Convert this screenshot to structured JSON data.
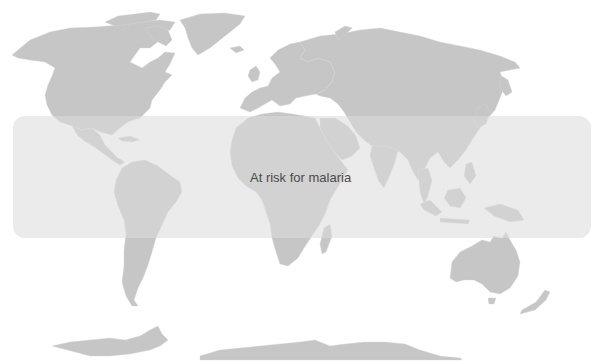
{
  "map": {
    "type": "world-map",
    "projection": "equirectangular-like",
    "colors": {
      "background": "#ffffff",
      "land": "#c6c6c6",
      "risk_band": "#e6e6e6",
      "label_text": "#4a4a4a"
    },
    "risk_zone": {
      "label": "At risk for malaria",
      "shape": "rounded-rectangle band across tropics",
      "bounds_px": {
        "x": 13,
        "y": 116,
        "width": 578,
        "height": 122
      }
    },
    "regions_shown": [
      "North America",
      "Greenland",
      "Europe",
      "Asia",
      "Africa",
      "South America",
      "Central America",
      "Australia",
      "New Zealand",
      "Southeast Asia",
      "Antarctica"
    ]
  }
}
